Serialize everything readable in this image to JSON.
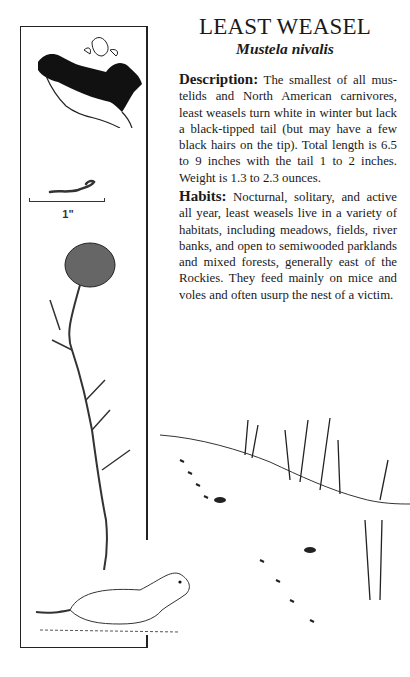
{
  "header": {
    "title": "LEAST WEASEL",
    "scientific_name": "Mustela nivalis"
  },
  "sections": [
    {
      "heading": "Description:",
      "body": "The smallest of all mus­telids and North American carnivores, least weasels turn white in winter but lack a black-tipped tail (but may have a few black hairs on the tip). Total length is 6.5 to 9 inches with the tail 1 to 2 inches. Weight is 1.3 to 2.3 ounces."
    },
    {
      "heading": "Habits:",
      "body": "Nocturnal, solitary, and active all year, least weasels live in a variety of habitats, including meadows, fields, river banks, and open to semiwooded park­lands and mixed forests, generally east of the Rockies. They feed mainly on mice and voles and often usurp the nest of a victim."
    }
  ],
  "sidebar": {
    "range_map": "north-america-range-map",
    "track_scale_label": "1\"",
    "illustrations": [
      "scat-track",
      "leaf",
      "twig",
      "least-weasel"
    ]
  },
  "scene": {
    "illustration": "snow-hillside-with-grass-and-tracks"
  },
  "colors": {
    "ink": "#1a1a1a",
    "paper": "#ffffff"
  }
}
